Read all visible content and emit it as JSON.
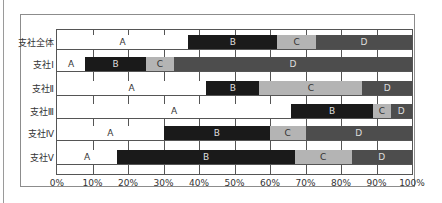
{
  "chart_data": {
    "type": "bar",
    "orientation": "horizontal",
    "stacked": true,
    "percent_stacked": true,
    "title": "",
    "xlabel": "",
    "ylabel": "",
    "xlim": [
      0,
      100
    ],
    "grid": true,
    "legend": "none (segments labeled inline)",
    "categories": [
      "支社全体",
      "支社Ⅰ",
      "支社Ⅱ",
      "支社Ⅲ",
      "支社Ⅳ",
      "支社Ⅴ"
    ],
    "series": [
      {
        "name": "A",
        "color": "#ffffff",
        "values": [
          37,
          8,
          42,
          66,
          30,
          17
        ]
      },
      {
        "name": "B",
        "color": "#1a1a1a",
        "values": [
          25,
          17,
          15,
          23,
          30,
          50
        ]
      },
      {
        "name": "C",
        "color": "#b4b4b4",
        "values": [
          11,
          8,
          29,
          5,
          10,
          16
        ]
      },
      {
        "name": "D",
        "color": "#4d4d4d",
        "values": [
          27,
          67,
          14,
          6,
          30,
          17
        ]
      }
    ],
    "xticks": [
      "0%",
      "10%",
      "20%",
      "30%",
      "40%",
      "50%",
      "60%",
      "70%",
      "80%",
      "90%",
      "100%"
    ]
  }
}
